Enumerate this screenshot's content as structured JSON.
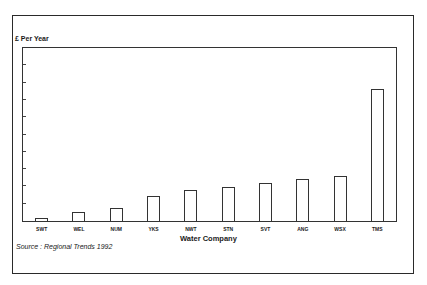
{
  "chart_data": {
    "type": "bar",
    "title": "",
    "ylabel": "£ Per Year",
    "xlabel": "Water Company",
    "categories": [
      "SWT",
      "WEL",
      "NUM",
      "YKS",
      "NWT",
      "STN",
      "SVT",
      "ANG",
      "WSX",
      "TMS"
    ],
    "values": [
      0.2,
      0.5,
      0.75,
      1.45,
      1.8,
      1.95,
      2.2,
      2.4,
      2.6,
      7.65
    ],
    "value_units": "tick intervals (no numeric tick labels shown)",
    "ylim": [
      0,
      10
    ],
    "yticks_count": 10,
    "grid": false,
    "legend": null,
    "source": "Source : Regional Trends 1992",
    "bar_fill": "#ffffff",
    "bar_stroke": "#333333"
  }
}
